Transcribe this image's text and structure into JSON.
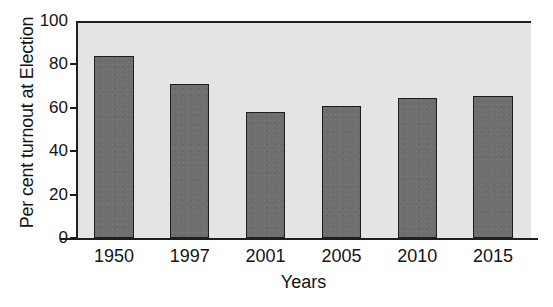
{
  "chart_data": {
    "type": "bar",
    "title": "",
    "categories": [
      "1950",
      "1997",
      "2001",
      "2005",
      "2010",
      "2015"
    ],
    "values": [
      84,
      71,
      58,
      61,
      64.5,
      65.5
    ],
    "xlabel": "Years",
    "ylabel": "Per cent turnout at Election",
    "ylim": [
      0,
      100
    ],
    "yticks": [
      0,
      20,
      40,
      60,
      80,
      100
    ],
    "ytick_labels": [
      "0",
      "20",
      "40",
      "60",
      "80",
      "100"
    ],
    "grid": false,
    "legend": null,
    "colors": {
      "bar_fill": "#6f6f6f",
      "bar_edge": "#1d1d1d",
      "plot_background": "#e4e4e4",
      "axis": "#1f1f1f",
      "text": "#131313",
      "page_background": "#ffffff"
    }
  }
}
